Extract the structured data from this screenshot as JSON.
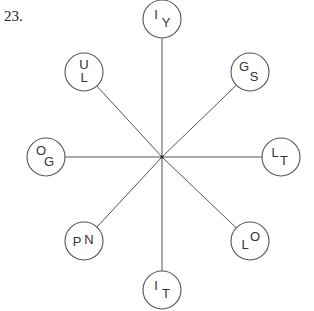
{
  "question_number": "23.",
  "center": {
    "x": 162,
    "y": 157
  },
  "radius": 19,
  "nodes": [
    {
      "id": "top",
      "cx": 162,
      "cy": 19,
      "letters": [
        {
          "t": "I",
          "dx": -6,
          "dy": -3
        },
        {
          "t": "Y",
          "dx": 4,
          "dy": 5
        }
      ]
    },
    {
      "id": "top-right",
      "cx": 250,
      "cy": 72,
      "letters": [
        {
          "t": "G",
          "dx": -6,
          "dy": -4
        },
        {
          "t": "S",
          "dx": 4,
          "dy": 6
        }
      ]
    },
    {
      "id": "right",
      "cx": 281,
      "cy": 157,
      "letters": [
        {
          "t": "L",
          "dx": -6,
          "dy": -3
        },
        {
          "t": "T",
          "dx": 3,
          "dy": 5
        }
      ]
    },
    {
      "id": "bottom-right",
      "cx": 250,
      "cy": 241,
      "letters": [
        {
          "t": "L",
          "dx": -5,
          "dy": 5
        },
        {
          "t": "O",
          "dx": 5,
          "dy": -3
        }
      ]
    },
    {
      "id": "bottom",
      "cx": 162,
      "cy": 290,
      "letters": [
        {
          "t": "I",
          "dx": -6,
          "dy": -3
        },
        {
          "t": "T",
          "dx": 4,
          "dy": 5
        }
      ]
    },
    {
      "id": "bottom-left",
      "cx": 84,
      "cy": 241,
      "letters": [
        {
          "t": "P",
          "dx": -7,
          "dy": 2
        },
        {
          "t": "N",
          "dx": 5,
          "dy": 0
        }
      ]
    },
    {
      "id": "left",
      "cx": 46,
      "cy": 157,
      "letters": [
        {
          "t": "O",
          "dx": -5,
          "dy": -5
        },
        {
          "t": "G",
          "dx": 3,
          "dy": 6
        }
      ]
    },
    {
      "id": "top-left",
      "cx": 84,
      "cy": 72,
      "letters": [
        {
          "t": "U",
          "dx": 0,
          "dy": -6
        },
        {
          "t": "L",
          "dx": 0,
          "dy": 7
        }
      ]
    }
  ]
}
